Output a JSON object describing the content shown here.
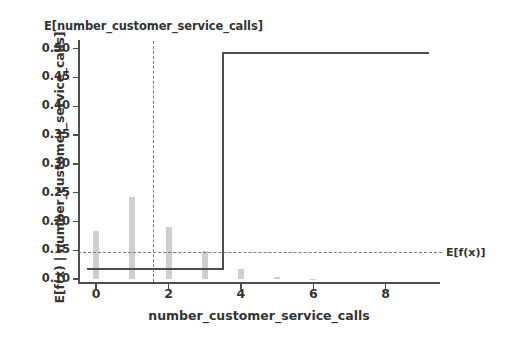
{
  "chart_data": {
    "type": "bar",
    "title": "E[number_customer_service_calls]",
    "xlabel": "number_customer_service_calls",
    "ylabel": "E[f(x) | number_customer_service_calls]",
    "xlim": [
      -0.5,
      9.5
    ],
    "ylim": [
      0.095,
      0.515
    ],
    "grid": false,
    "legend": "none",
    "xticks": [
      "0",
      "2",
      "4",
      "6",
      "8"
    ],
    "xtick_values": [
      0,
      2,
      4,
      6,
      8
    ],
    "yticks": [
      "0.10",
      "0.15",
      "0.20",
      "0.25",
      "0.30",
      "0.35",
      "0.40",
      "0.45",
      "0.50"
    ],
    "ytick_values": [
      0.1,
      0.15,
      0.2,
      0.25,
      0.3,
      0.35,
      0.4,
      0.45,
      0.5
    ],
    "categories": [
      0,
      1,
      2,
      3,
      4,
      5,
      6,
      7,
      8,
      9
    ],
    "series": [
      {
        "name": "histogram_density",
        "kind": "bar",
        "color": "#cfcfcf",
        "values": [
          0.183,
          0.243,
          0.191,
          0.148,
          0.118,
          0.104,
          0.101,
          0.1,
          0.1,
          0.1
        ],
        "baseline": 0.1
      },
      {
        "name": "E[f(x) | number_customer_service_calls]",
        "kind": "step",
        "color": "#4d4d4d",
        "x": [
          -0.25,
          3.5,
          3.5,
          9.2
        ],
        "y": [
          0.118,
          0.118,
          0.493,
          0.493
        ]
      }
    ],
    "annotations": [
      {
        "name": "expected-value-line",
        "kind": "hline",
        "label": "E[f(x)]",
        "value": 0.1465,
        "style": "dashed",
        "color": "#7a7a7a"
      },
      {
        "name": "mean-feature-value-line",
        "kind": "vline",
        "label": "E[number_customer_service_calls]",
        "value": 1.58,
        "style": "dashed",
        "color": "#7a7a7a"
      }
    ]
  },
  "colors": {
    "bar": "#cfcfcf",
    "line": "#4d4d4d",
    "dashed": "#7a7a7a",
    "text": "#333333",
    "background": "#ffffff"
  }
}
